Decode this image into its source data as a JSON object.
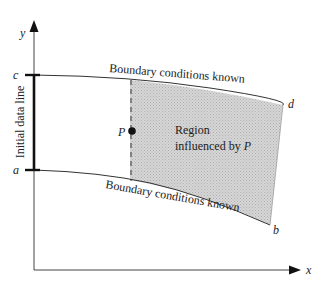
{
  "diagram": {
    "axes": {
      "x_label": "x",
      "y_label": "y"
    },
    "points": {
      "c": "c",
      "a": "a",
      "d": "d",
      "b": "b",
      "P": "P"
    },
    "labels": {
      "initial_data_line": "Initial data line",
      "top_boundary": "Boundary conditions known",
      "bottom_boundary": "Boundary conditions known",
      "region_line1": "Region",
      "region_line2": "influenced by ",
      "region_line2_point": "P"
    },
    "colors": {
      "line": "#333333",
      "region_fill": "#cfcfcf",
      "axis": "#444444"
    }
  }
}
